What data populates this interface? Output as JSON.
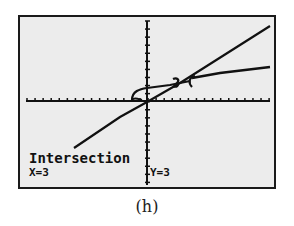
{
  "screen": {
    "title": "Intersection",
    "x_readout": "X=3",
    "y_readout": "Y=3",
    "background": "#ececec",
    "ink": "#111111"
  },
  "caption": "(h)",
  "graph": {
    "x_axis_ticks": 24,
    "y_axis_ticks": 20,
    "cursor_icon": "intersection-cursor-icon",
    "curves": [
      "line y=x",
      "curve intersecting line at (3,3)"
    ],
    "intersection": {
      "x": 3,
      "y": 3
    }
  }
}
